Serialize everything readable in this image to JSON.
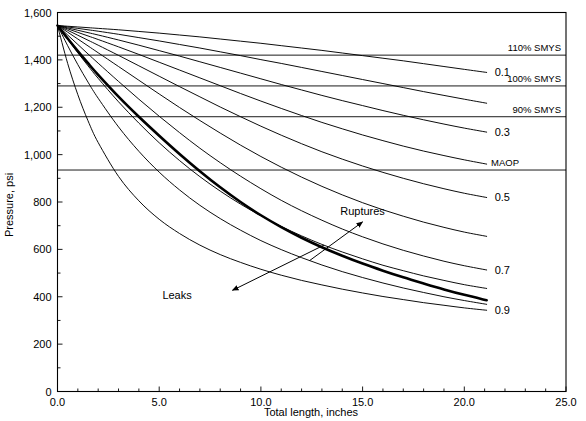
{
  "chart_data": {
    "type": "line",
    "title": "",
    "xlabel": "Total length, inches",
    "ylabel": "Pressure, psi",
    "xlim": [
      0.0,
      25.0
    ],
    "ylim": [
      0,
      1600
    ],
    "xticks": [
      "0.0",
      "5.0",
      "10.0",
      "15.0",
      "20.0",
      "25.0"
    ],
    "xtick_values": [
      0,
      5,
      10,
      15,
      20,
      25
    ],
    "xminor_step": 1.0,
    "yticks": [
      "0",
      "200",
      "400",
      "600",
      "800",
      "1,000",
      "1,200",
      "1,400",
      "1,600"
    ],
    "ytick_values": [
      0,
      200,
      400,
      600,
      800,
      1000,
      1200,
      1400,
      1600
    ],
    "grid": false,
    "legend_position": "right-inline",
    "origin_pressure": 1545,
    "reference_lines": [
      {
        "name": "110% SMYS",
        "label": "110% SMYS",
        "value": 1420
      },
      {
        "name": "100% SMYS",
        "label": "100% SMYS",
        "value": 1290
      },
      {
        "name": "90% SMYS",
        "label": "90% SMYS",
        "value": 1160
      },
      {
        "name": "MAOP",
        "label": "MAOP",
        "value": 935
      }
    ],
    "series": [
      {
        "name": "0.1",
        "label": "0.1",
        "label_shown": true,
        "x": [
          0,
          0.5,
          1,
          1.5,
          2,
          3,
          4,
          5,
          6,
          7,
          8,
          9,
          10,
          11,
          12,
          13,
          14,
          15,
          16,
          17,
          18,
          19,
          20,
          21.1
        ],
        "y": [
          1545,
          1542,
          1539,
          1536,
          1533,
          1527,
          1520,
          1513,
          1505,
          1497,
          1488,
          1479,
          1470,
          1460,
          1450,
          1440,
          1429,
          1418,
          1407,
          1396,
          1384,
          1372,
          1360,
          1347
        ]
      },
      {
        "name": "0.2",
        "label": "0.2",
        "label_shown": false,
        "x": [
          0,
          0.5,
          1,
          1.5,
          2,
          3,
          4,
          5,
          6,
          7,
          8,
          9,
          10,
          11,
          12,
          13,
          14,
          15,
          16,
          17,
          18,
          19,
          20,
          21.1
        ],
        "y": [
          1545,
          1539,
          1533,
          1527,
          1521,
          1508,
          1494,
          1480,
          1465,
          1450,
          1434,
          1418,
          1401,
          1385,
          1368,
          1351,
          1334,
          1317,
          1300,
          1283,
          1266,
          1250,
          1234,
          1217
        ]
      },
      {
        "name": "0.3",
        "label": "0.3",
        "label_shown": true,
        "x": [
          0,
          0.5,
          1,
          1.5,
          2,
          3,
          4,
          5,
          6,
          7,
          8,
          9,
          10,
          11,
          12,
          13,
          14,
          15,
          16,
          17,
          18,
          19,
          20,
          21.1
        ],
        "y": [
          1545,
          1535,
          1525,
          1515,
          1505,
          1484,
          1462,
          1439,
          1416,
          1392,
          1368,
          1344,
          1320,
          1296,
          1273,
          1250,
          1228,
          1207,
          1186,
          1166,
          1147,
          1129,
          1112,
          1095
        ]
      },
      {
        "name": "0.4",
        "label": "0.4",
        "label_shown": false,
        "x": [
          0,
          0.5,
          1,
          1.5,
          2,
          3,
          4,
          5,
          6,
          7,
          8,
          9,
          10,
          11,
          12,
          13,
          14,
          15,
          16,
          17,
          18,
          19,
          20,
          21.1
        ],
        "y": [
          1545,
          1531,
          1516,
          1501,
          1486,
          1455,
          1423,
          1390,
          1357,
          1324,
          1291,
          1258,
          1226,
          1195,
          1165,
          1136,
          1109,
          1083,
          1059,
          1036,
          1015,
          996,
          978,
          960
        ]
      },
      {
        "name": "0.5",
        "label": "0.5",
        "label_shown": true,
        "x": [
          0,
          0.5,
          1,
          1.5,
          2,
          3,
          4,
          5,
          6,
          7,
          8,
          9,
          10,
          11,
          12,
          13,
          14,
          15,
          16,
          17,
          18,
          19,
          20,
          21.1
        ],
        "y": [
          1545,
          1525,
          1504,
          1483,
          1462,
          1419,
          1375,
          1331,
          1287,
          1244,
          1201,
          1160,
          1120,
          1082,
          1046,
          1012,
          981,
          952,
          925,
          900,
          877,
          856,
          837,
          819
        ]
      },
      {
        "name": "0.6",
        "label": "0.6",
        "label_shown": false,
        "x": [
          0,
          0.5,
          1,
          1.5,
          2,
          3,
          4,
          5,
          6,
          7,
          8,
          9,
          10,
          11,
          12,
          13,
          14,
          15,
          16,
          17,
          18,
          19,
          20,
          21.1
        ],
        "y": [
          1545,
          1517,
          1488,
          1459,
          1430,
          1372,
          1314,
          1256,
          1199,
          1144,
          1091,
          1040,
          992,
          947,
          905,
          866,
          830,
          797,
          767,
          740,
          715,
          693,
          673,
          655
        ]
      },
      {
        "name": "0.7",
        "label": "0.7",
        "label_shown": true,
        "x": [
          0,
          0.5,
          1,
          1.5,
          2,
          3,
          4,
          5,
          6,
          7,
          8,
          9,
          10,
          11,
          12,
          13,
          14,
          15,
          16,
          17,
          18,
          19,
          20,
          21.1
        ],
        "y": [
          1545,
          1505,
          1465,
          1425,
          1386,
          1309,
          1234,
          1162,
          1093,
          1027,
          966,
          909,
          856,
          807,
          763,
          723,
          686,
          653,
          623,
          596,
          572,
          550,
          531,
          513
        ]
      },
      {
        "name": "0.8",
        "label": "0.8",
        "label_shown": false,
        "x": [
          0,
          0.5,
          1,
          1.5,
          2,
          3,
          4,
          5,
          6,
          7,
          8,
          9,
          10,
          11,
          12,
          13,
          14,
          15,
          16,
          17,
          18,
          19,
          20,
          21.1
        ],
        "y": [
          1545,
          1487,
          1430,
          1375,
          1322,
          1223,
          1133,
          1050,
          975,
          907,
          846,
          791,
          742,
          697,
          657,
          621,
          589,
          560,
          533,
          510,
          488,
          469,
          451,
          435
        ]
      },
      {
        "name": "0.85",
        "label": "0.85",
        "label_shown": false,
        "x": [
          0,
          0.5,
          1,
          1.5,
          2,
          3,
          4,
          5,
          6,
          7,
          8,
          9,
          10,
          11,
          12,
          13,
          14,
          15,
          16,
          17,
          18,
          19,
          20,
          21.1
        ],
        "y": [
          1545,
          1460,
          1380,
          1306,
          1238,
          1117,
          1014,
          926,
          851,
          786,
          730,
          681,
          637,
          599,
          565,
          534,
          506,
          481,
          458,
          437,
          418,
          400,
          384,
          368
        ]
      },
      {
        "name": "0.9",
        "label": "0.9",
        "label_shown": true,
        "x": [
          0,
          0.5,
          1,
          1.5,
          2,
          3,
          4,
          5,
          6,
          7,
          8,
          9,
          10,
          11,
          12,
          13,
          14,
          15,
          16,
          17,
          18,
          19,
          20,
          21.1
        ],
        "y": [
          1545,
          1385,
          1253,
          1143,
          1051,
          908,
          805,
          727,
          667,
          618,
          578,
          545,
          516,
          491,
          469,
          450,
          432,
          416,
          401,
          388,
          375,
          364,
          353,
          343
        ]
      },
      {
        "name": "failure-boundary",
        "label": "",
        "label_shown": false,
        "emphasis": true,
        "x": [
          0,
          0.5,
          1,
          1.5,
          2,
          3,
          4,
          5,
          6,
          7,
          8,
          9,
          10,
          11,
          12,
          13,
          14,
          15,
          16,
          17,
          18,
          19,
          20,
          21.1
        ],
        "y": [
          1545,
          1490,
          1437,
          1386,
          1337,
          1245,
          1160,
          1080,
          1003,
          930,
          862,
          800,
          744,
          694,
          649,
          609,
          573,
          540,
          510,
          482,
          456,
          431,
          408,
          385
        ]
      }
    ],
    "annotations": [
      {
        "name": "ruptures",
        "label": "Ruptures",
        "text_x": 13.9,
        "text_y": 747,
        "arrow_from_x": 12.4,
        "arrow_from_y": 553,
        "arrow_to_x": 15.0,
        "arrow_to_y": 716
      },
      {
        "name": "leaks",
        "label": "Leaks",
        "text_x": 6.6,
        "text_y": 392,
        "arrow_from_x": 13.1,
        "arrow_from_y": 618,
        "arrow_to_x": 8.6,
        "arrow_to_y": 427
      }
    ]
  }
}
